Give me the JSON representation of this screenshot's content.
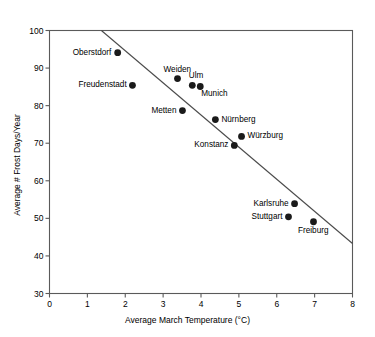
{
  "chart_data": {
    "type": "scatter",
    "title": "",
    "xlabel": "Average March Temperature (°C)",
    "ylabel": "Average # Frost Days/Year",
    "xlim": [
      0,
      8
    ],
    "ylim": [
      30,
      100
    ],
    "xticks": [
      "0",
      "1",
      "2",
      "3",
      "4",
      "5",
      "6",
      "7",
      "8"
    ],
    "yticks": [
      "30",
      "40",
      "50",
      "60",
      "70",
      "80",
      "90",
      "100"
    ],
    "grid": false,
    "legend": "none",
    "marker_color": "#1a1a1a",
    "axis_color": "#5a5a5a",
    "trendline": {
      "type": "line",
      "label": "regression-line",
      "x": [
        1.37,
        8.0
      ],
      "y": [
        100.0,
        43.3
      ],
      "color": "#4a4a4a"
    },
    "points": [
      {
        "name": "Oberstdorf",
        "x": 1.8,
        "y": 94.1,
        "label_side": "left"
      },
      {
        "name": "Freudenstadt",
        "x": 2.19,
        "y": 85.4,
        "label_side": "left"
      },
      {
        "name": "Weiden",
        "x": 3.38,
        "y": 87.2,
        "label_side": "above"
      },
      {
        "name": "Ulm",
        "x": 3.77,
        "y": 85.4,
        "label_side": "above-right"
      },
      {
        "name": "Munich",
        "x": 3.98,
        "y": 85.1,
        "label_side": "below-right"
      },
      {
        "name": "Metten",
        "x": 3.51,
        "y": 78.7,
        "label_side": "left"
      },
      {
        "name": "Nürnberg",
        "x": 4.38,
        "y": 76.3,
        "label_side": "right"
      },
      {
        "name": "Würzburg",
        "x": 5.07,
        "y": 71.8,
        "label_side": "right"
      },
      {
        "name": "Konstanz",
        "x": 4.88,
        "y": 69.4,
        "label_side": "left"
      },
      {
        "name": "Karlsruhe",
        "x": 6.47,
        "y": 53.9,
        "label_side": "left"
      },
      {
        "name": "Stuttgart",
        "x": 6.31,
        "y": 50.4,
        "label_side": "left"
      },
      {
        "name": "Freiburg",
        "x": 6.97,
        "y": 49.1,
        "label_side": "below"
      }
    ]
  }
}
